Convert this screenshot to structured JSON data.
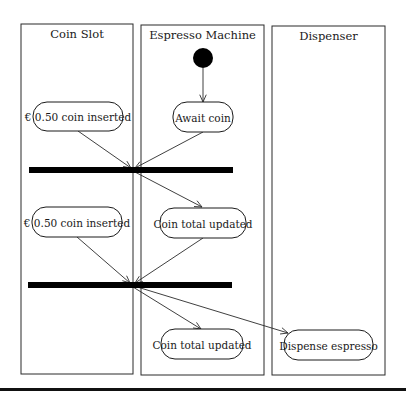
{
  "diagram": {
    "type": "UML activity diagram with swimlanes",
    "lanes": [
      {
        "id": "coin-slot",
        "title": "Coin Slot",
        "x": 21,
        "y": 24,
        "w": 112,
        "h": 350
      },
      {
        "id": "espresso-machine",
        "title": "Espresso Machine",
        "x": 141,
        "y": 25,
        "w": 123,
        "h": 350
      },
      {
        "id": "dispenser",
        "title": "Dispenser",
        "x": 272,
        "y": 26,
        "w": 113,
        "h": 349
      }
    ],
    "initial_node": {
      "cx": 203,
      "cy": 58,
      "r": 10
    },
    "actions": [
      {
        "id": "coin-inserted-1",
        "label": "€ 0.50 coin inserted",
        "x": 33,
        "y": 102,
        "w": 90,
        "h": 29
      },
      {
        "id": "await-coin",
        "label": "Await coin",
        "x": 173,
        "y": 102,
        "w": 60,
        "h": 30
      },
      {
        "id": "coin-inserted-2",
        "label": "€ 0.50 coin inserted",
        "x": 32,
        "y": 207,
        "w": 90,
        "h": 30
      },
      {
        "id": "coin-total-updated-1",
        "label": "Coin total updated",
        "x": 160,
        "y": 208,
        "w": 86,
        "h": 30
      },
      {
        "id": "coin-total-updated-2",
        "label": "Coin total updated",
        "x": 161,
        "y": 329,
        "w": 82,
        "h": 30
      },
      {
        "id": "dispense-espresso",
        "label": "Dispense espresso",
        "x": 284,
        "y": 330,
        "w": 89,
        "h": 30
      }
    ],
    "sync_bars": [
      {
        "id": "join-fork-1",
        "x": 29,
        "y": 167,
        "w": 204,
        "h": 6
      },
      {
        "id": "join-fork-2",
        "x": 28,
        "y": 282,
        "w": 204,
        "h": 6
      }
    ],
    "flows": [
      {
        "from": "initial",
        "to": "await-coin",
        "x1": 203,
        "y1": 68,
        "x2": 203,
        "y2": 102
      },
      {
        "from": "coin-inserted-1",
        "to": "join-fork-1",
        "x1": 78,
        "y1": 131,
        "x2": 131,
        "y2": 168
      },
      {
        "from": "await-coin",
        "to": "join-fork-1",
        "x1": 203,
        "y1": 132,
        "x2": 135,
        "y2": 168
      },
      {
        "from": "join-fork-1",
        "to": "coin-total-updated-1",
        "x1": 133,
        "y1": 171,
        "x2": 202,
        "y2": 207
      },
      {
        "from": "coin-inserted-2",
        "to": "join-fork-2",
        "x1": 77,
        "y1": 237,
        "x2": 130,
        "y2": 283
      },
      {
        "from": "coin-total-updated-1",
        "to": "join-fork-2",
        "x1": 203,
        "y1": 238,
        "x2": 135,
        "y2": 283
      },
      {
        "from": "join-fork-2",
        "to": "coin-total-updated-2",
        "x1": 133,
        "y1": 287,
        "x2": 201,
        "y2": 329
      },
      {
        "from": "join-fork-2",
        "to": "dispense-espresso",
        "x1": 134,
        "y1": 286,
        "x2": 288,
        "y2": 333
      }
    ],
    "bottom_rule": {
      "x": 0,
      "y": 388,
      "w": 406,
      "h": 3
    }
  }
}
